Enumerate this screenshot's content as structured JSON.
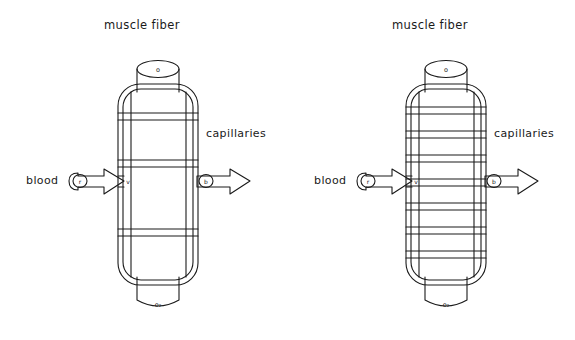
{
  "figure": {
    "type": "diagram",
    "stroke_color": "#1a1a1a",
    "background_color": "#ffffff",
    "panels": [
      {
        "id": "left-panel",
        "name": "low-capillary-density-diagram",
        "labels": {
          "title": "muscle  fiber",
          "capillaries": "capillaries",
          "blood": "blood",
          "top_cap_marker": "o",
          "bottom_cap_marker": "o₂",
          "inlet_marker": "r",
          "outlet_marker": "b",
          "junction_marker": "v"
        },
        "capillary_count": 3,
        "capillary_band_y": [
          116,
          163,
          232
        ],
        "fiber": {
          "left": 118,
          "right": 198,
          "top": 84,
          "bottom": 285,
          "corner_radius": 22,
          "inner_inset": 5,
          "vertical_lines_x": [
            131,
            186
          ]
        },
        "cylinder_top": {
          "x": 137,
          "y": 52,
          "width": 42,
          "height": 34
        },
        "cylinder_bottom": {
          "x": 137,
          "y": 282,
          "width": 42,
          "height": 36
        },
        "arrow_in": {
          "x": 70,
          "y": 180,
          "width": 54,
          "height": 22
        },
        "arrow_out": {
          "x": 196,
          "y": 180,
          "width": 54,
          "height": 22
        }
      },
      {
        "id": "right-panel",
        "name": "high-capillary-density-diagram",
        "labels": {
          "title": "muscle  fiber",
          "capillaries": "capillaries",
          "blood": "blood",
          "top_cap_marker": "o",
          "bottom_cap_marker": "o₂",
          "inlet_marker": "r",
          "outlet_marker": "b",
          "junction_marker": "v"
        },
        "capillary_count": 7,
        "capillary_band_y": [
          110,
          134,
          158,
          182,
          206,
          230,
          254
        ],
        "fiber": {
          "left": 118,
          "right": 198,
          "top": 84,
          "bottom": 285,
          "corner_radius": 22,
          "inner_inset": 5,
          "vertical_lines_x": [
            131,
            186
          ]
        },
        "cylinder_top": {
          "x": 137,
          "y": 52,
          "width": 42,
          "height": 34
        },
        "cylinder_bottom": {
          "x": 137,
          "y": 282,
          "width": 42,
          "height": 36
        },
        "arrow_in": {
          "x": 70,
          "y": 180,
          "width": 54,
          "height": 22
        },
        "arrow_out": {
          "x": 196,
          "y": 180,
          "width": 54,
          "height": 22
        }
      }
    ]
  }
}
